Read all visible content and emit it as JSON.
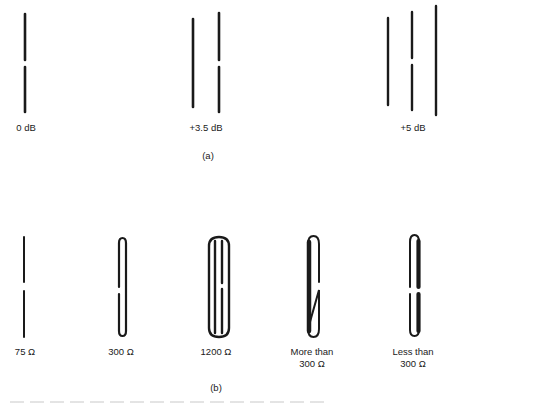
{
  "figure": {
    "part_a": {
      "caption": "(a)",
      "items": [
        {
          "label": "0 dB",
          "description": "single split dipole"
        },
        {
          "label": "+3.5 dB",
          "description": "split dipole with one parasitic element"
        },
        {
          "label": "+5 dB",
          "description": "split dipole with reflector and director"
        }
      ]
    },
    "part_b": {
      "caption": "(b)",
      "items": [
        {
          "label": "75 Ω",
          "description": "simple split dipole"
        },
        {
          "label": "300 Ω",
          "description": "folded dipole"
        },
        {
          "label": "1200 Ω",
          "description": "three-wire folded dipole"
        },
        {
          "label_line1": "More than",
          "label_line2": "300 Ω",
          "description": "folded dipole with thicker unbroken conductor"
        },
        {
          "label_line1": "Less than",
          "label_line2": "300 Ω",
          "description": "folded dipole with thicker split conductor"
        }
      ]
    }
  },
  "colors": {
    "ink": "#1a1a1a",
    "background": "#ffffff"
  }
}
